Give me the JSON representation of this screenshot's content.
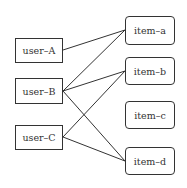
{
  "diagram": {
    "type": "bipartite-graph",
    "users": [
      {
        "id": "A",
        "label": "user–A",
        "x": 15,
        "y": 38,
        "w": 48,
        "h": 25
      },
      {
        "id": "B",
        "label": "user–B",
        "x": 15,
        "y": 78,
        "w": 48,
        "h": 26
      },
      {
        "id": "C",
        "label": "user–C",
        "x": 15,
        "y": 125,
        "w": 48,
        "h": 25
      }
    ],
    "items": [
      {
        "id": "a",
        "label": "item–a",
        "x": 125,
        "y": 16,
        "w": 50,
        "h": 29
      },
      {
        "id": "b",
        "label": "item–b",
        "x": 125,
        "y": 57,
        "w": 50,
        "h": 28
      },
      {
        "id": "c",
        "label": "item–c",
        "x": 125,
        "y": 101,
        "w": 50,
        "h": 28
      },
      {
        "id": "d",
        "label": "item–d",
        "x": 125,
        "y": 147,
        "w": 50,
        "h": 28
      }
    ],
    "edges": [
      {
        "from": "A",
        "to": "a"
      },
      {
        "from": "B",
        "to": "a"
      },
      {
        "from": "B",
        "to": "b"
      },
      {
        "from": "B",
        "to": "d"
      },
      {
        "from": "C",
        "to": "b"
      },
      {
        "from": "C",
        "to": "d"
      }
    ],
    "colors": {
      "stroke": "#333333",
      "background": "#ffffff"
    }
  }
}
